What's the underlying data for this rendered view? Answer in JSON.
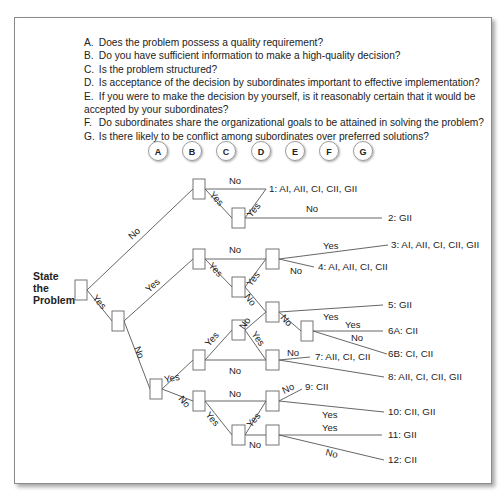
{
  "questions": [
    {
      "letter": "A.",
      "text": "Does the problem possess a quality requirement?"
    },
    {
      "letter": "B.",
      "text": "Do you have sufficient information to make a high-quality decision?"
    },
    {
      "letter": "C.",
      "text": "Is the problem structured?"
    },
    {
      "letter": "D.",
      "text": "Is acceptance of the decision by subordinates important to effective implementation?"
    },
    {
      "letter": "E.",
      "text": "If you were to make the decision by yourself, is it reasonably certain that it would be",
      "continuation": "accepted by your subordinates?"
    },
    {
      "letter": "F.",
      "text": "Do subordinates share the organizational goals to be attained in solving the problem?"
    },
    {
      "letter": "G.",
      "text": "Is there likely to be conflict among subordinates over preferred solutions?"
    }
  ],
  "columns": [
    "A",
    "B",
    "C",
    "D",
    "E",
    "F",
    "G"
  ],
  "start": {
    "line1": "State",
    "line2": "the",
    "line3": "Problem"
  },
  "branch_labels": {
    "yes": "Yes",
    "no": "No"
  },
  "outcomes": [
    {
      "id": "1",
      "label": "1:  AI, AII, CI, CII, GII"
    },
    {
      "id": "2",
      "label": "2:  GII"
    },
    {
      "id": "3",
      "label": "3:  AI, AII, CI, CII, GII"
    },
    {
      "id": "4",
      "label": "4:  AI, AII, CI, CII"
    },
    {
      "id": "5",
      "label": "5:  GII"
    },
    {
      "id": "6A",
      "label": "6A:  CII"
    },
    {
      "id": "6B",
      "label": "6B:  CI, CII"
    },
    {
      "id": "7",
      "label": "7:  AII, CI, CII"
    },
    {
      "id": "8",
      "label": "8:  AII, CI, CII, GII"
    },
    {
      "id": "9",
      "label": "9:  CII"
    },
    {
      "id": "10",
      "label": "10:  CII, GII"
    },
    {
      "id": "11",
      "label": "11: GII"
    },
    {
      "id": "12",
      "label": "12: CII"
    }
  ],
  "colors": {
    "line": "#555555",
    "text": "#222222",
    "frame": "#8a8a8a"
  }
}
